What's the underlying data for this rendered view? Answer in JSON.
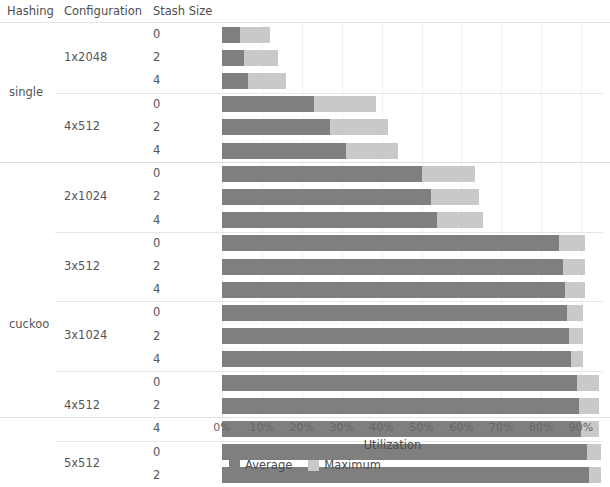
{
  "header": {
    "hashing": "Hashing",
    "configuration": "Configuration",
    "stash_size": "Stash Size"
  },
  "axis": {
    "title": "Utilization",
    "ticks": [
      "0%",
      "10%",
      "20%",
      "30%",
      "40%",
      "50%",
      "60%",
      "70%",
      "80%",
      "90%"
    ]
  },
  "legend": {
    "items": [
      {
        "label": "Average",
        "color": "#7f7f7f"
      },
      {
        "label": "Maximum",
        "color": "#c9c9c9"
      }
    ]
  },
  "colors": {
    "average": "#7f7f7f",
    "maximum": "#c9c9c9",
    "grid": "#f1f1f1",
    "separator": "#e3e3e3",
    "text": "#555555"
  },
  "chart_data": {
    "type": "bar",
    "orientation": "horizontal",
    "stacked": false,
    "overlay": true,
    "title": "",
    "xlabel": "Utilization",
    "ylabel": "",
    "xlim": [
      0,
      96
    ],
    "xticks": [
      0,
      10,
      20,
      30,
      40,
      50,
      60,
      70,
      80,
      90
    ],
    "xtick_labels": [
      "0%",
      "10%",
      "20%",
      "30%",
      "40%",
      "50%",
      "60%",
      "70%",
      "80%",
      "90%"
    ],
    "grid": true,
    "legend_position": "bottom",
    "series": [
      {
        "name": "Average",
        "color": "#7f7f7f"
      },
      {
        "name": "Maximum",
        "color": "#c9c9c9"
      }
    ],
    "row_headers": [
      "Hashing",
      "Configuration",
      "Stash Size"
    ],
    "groups": [
      {
        "hashing": "single",
        "configs": [
          {
            "configuration": "1x2048",
            "rows": [
              {
                "stash_size": "0",
                "average": 4.5,
                "maximum": 12.0
              },
              {
                "stash_size": "2",
                "average": 5.5,
                "maximum": 14.0
              },
              {
                "stash_size": "4",
                "average": 6.5,
                "maximum": 16.0
              }
            ]
          },
          {
            "configuration": "4x512",
            "rows": [
              {
                "stash_size": "0",
                "average": 23.0,
                "maximum": 38.5
              },
              {
                "stash_size": "2",
                "average": 27.0,
                "maximum": 41.5
              },
              {
                "stash_size": "4",
                "average": 31.0,
                "maximum": 44.0
              }
            ]
          }
        ]
      },
      {
        "hashing": "cuckoo",
        "configs": [
          {
            "configuration": "2x1024",
            "rows": [
              {
                "stash_size": "0",
                "average": 50.0,
                "maximum": 63.5
              },
              {
                "stash_size": "2",
                "average": 52.5,
                "maximum": 64.5
              },
              {
                "stash_size": "4",
                "average": 54.0,
                "maximum": 65.5
              }
            ]
          },
          {
            "configuration": "3x512",
            "rows": [
              {
                "stash_size": "0",
                "average": 84.5,
                "maximum": 91.0
              },
              {
                "stash_size": "2",
                "average": 85.5,
                "maximum": 91.0
              },
              {
                "stash_size": "4",
                "average": 86.0,
                "maximum": 91.0
              }
            ]
          },
          {
            "configuration": "3x1024",
            "rows": [
              {
                "stash_size": "0",
                "average": 86.5,
                "maximum": 90.5
              },
              {
                "stash_size": "2",
                "average": 87.0,
                "maximum": 90.5
              },
              {
                "stash_size": "4",
                "average": 87.5,
                "maximum": 90.5
              }
            ]
          },
          {
            "configuration": "4x512",
            "rows": [
              {
                "stash_size": "0",
                "average": 89.0,
                "maximum": 94.5
              },
              {
                "stash_size": "2",
                "average": 89.5,
                "maximum": 94.5
              },
              {
                "stash_size": "4",
                "average": 90.0,
                "maximum": 94.5
              }
            ]
          },
          {
            "configuration": "5x512",
            "rows": [
              {
                "stash_size": "0",
                "average": 91.5,
                "maximum": 95.0
              },
              {
                "stash_size": "2",
                "average": 92.0,
                "maximum": 95.0
              }
            ]
          }
        ]
      }
    ]
  }
}
